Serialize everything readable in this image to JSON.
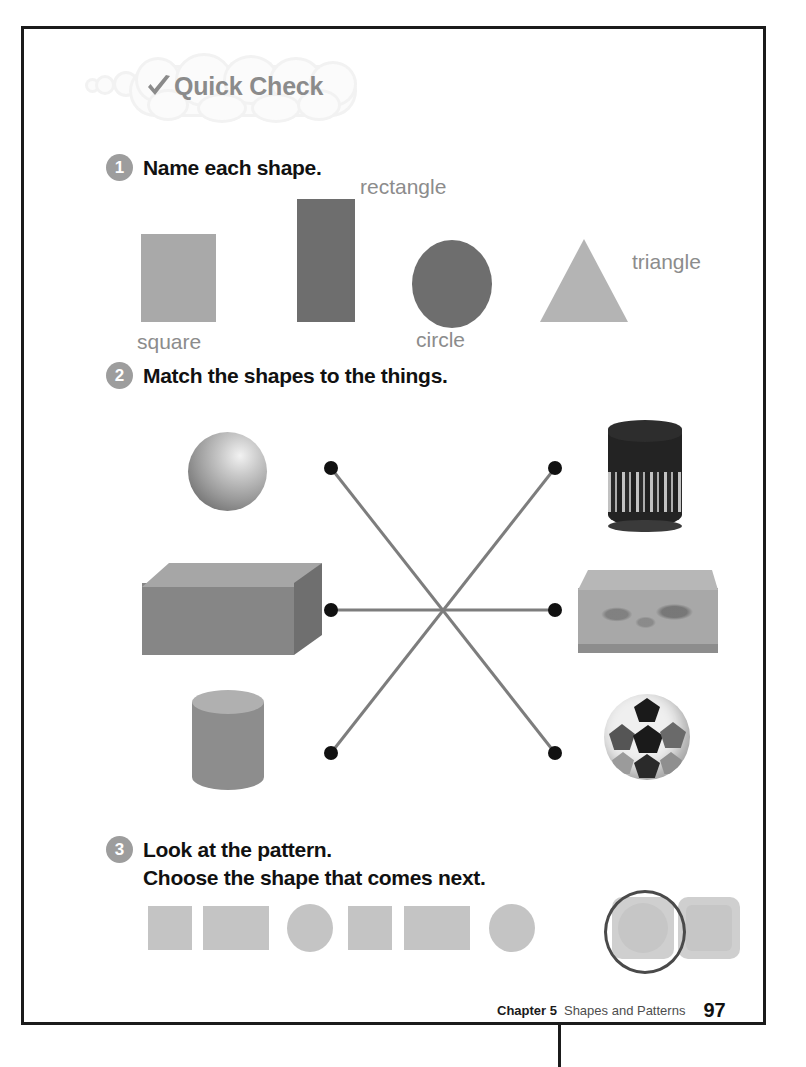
{
  "banner": {
    "label": "Quick Check",
    "icon": "checkmark-icon",
    "color": "#8b8b8b"
  },
  "questions": [
    {
      "number": "1",
      "text": "Name each shape."
    },
    {
      "number": "2",
      "text": "Match the shapes to the things."
    },
    {
      "number": "3",
      "line1": "Look at the pattern.",
      "line2": "Choose the shape that comes next."
    }
  ],
  "q1": {
    "shapes": [
      {
        "name": "square",
        "label": "square",
        "color": "#a9a9a9"
      },
      {
        "name": "rectangle",
        "label": "rectangle",
        "color": "#6e6e6e"
      },
      {
        "name": "circle",
        "label": "circle",
        "color": "#6e6e6e"
      },
      {
        "name": "triangle",
        "label": "triangle",
        "color": "#b4b4b4"
      }
    ]
  },
  "q2": {
    "left_figures": [
      {
        "name": "sphere",
        "label": "sphere"
      },
      {
        "name": "rectangular-prism",
        "label": "rectangular prism"
      },
      {
        "name": "cylinder",
        "label": "cylinder"
      }
    ],
    "right_objects": [
      {
        "name": "tin-canister",
        "label": "tin canister"
      },
      {
        "name": "gift-box",
        "label": "decorated box"
      },
      {
        "name": "soccer-ball",
        "label": "soccer ball"
      }
    ],
    "connections": [
      {
        "from": "left-dot-top",
        "to": "right-dot-bottom"
      },
      {
        "from": "left-dot-middle",
        "to": "right-dot-middle"
      },
      {
        "from": "left-dot-bottom",
        "to": "right-dot-top"
      }
    ],
    "dot_color": "#111111",
    "line_color": "#7d7d7d"
  },
  "q3": {
    "pattern": [
      "square",
      "rectangle",
      "circle",
      "square",
      "rectangle",
      "circle"
    ],
    "choices": [
      {
        "name": "circle-choice",
        "shape": "circle",
        "selected": true
      },
      {
        "name": "square-choice",
        "shape": "rounded-square",
        "selected": false
      }
    ],
    "pattern_color": "#c4c4c4",
    "answer_marker": "circled"
  },
  "footer": {
    "chapter": "Chapter 5",
    "title": "Shapes and Patterns",
    "page": "97"
  }
}
